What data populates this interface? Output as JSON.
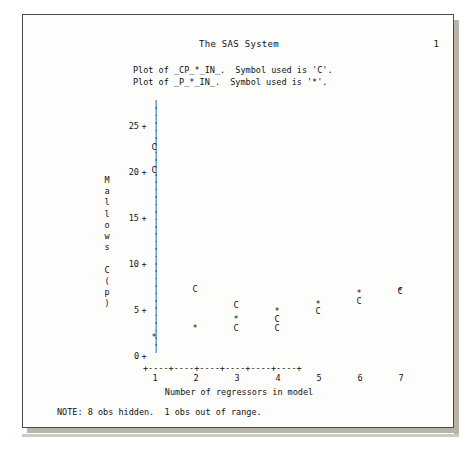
{
  "page": {
    "title": "The SAS System",
    "page_number": "1",
    "legend_line_1": "Plot of _CP_*_IN_.  Symbol used is 'C'.",
    "legend_line_2": "Plot of _P_*_IN_.  Symbol used is '*'.",
    "note": "NOTE: 8 obs hidden.  1 obs out of range."
  },
  "chart_data": {
    "type": "scatter",
    "title": "The SAS System",
    "xlabel": "Number of regressors in model",
    "ylabel": "Mallows C(p)",
    "ylabel_chars": [
      "M",
      "a",
      "l",
      "l",
      "o",
      "w",
      "s",
      "",
      "C",
      "(",
      "p",
      ")"
    ],
    "xlim": [
      1,
      7
    ],
    "ylim": [
      0,
      25
    ],
    "xticks": [
      "1",
      "2",
      "3",
      "4",
      "5",
      "6",
      "7"
    ],
    "yticks": [
      "25",
      "20",
      "15",
      "10",
      "5",
      "0"
    ],
    "grid": false,
    "legend_position": "top",
    "series": [
      {
        "name": "_CP_*_IN_",
        "symbol": "C",
        "points": [
          {
            "x": 1,
            "y": 23.0
          },
          {
            "x": 1,
            "y": 20.5
          },
          {
            "x": 2,
            "y": 7.6
          },
          {
            "x": 3,
            "y": 5.9
          },
          {
            "x": 3,
            "y": 3.4
          },
          {
            "x": 4,
            "y": 4.4
          },
          {
            "x": 4,
            "y": 3.4
          },
          {
            "x": 5,
            "y": 5.2
          },
          {
            "x": 6,
            "y": 6.3
          },
          {
            "x": 7,
            "y": 7.4
          }
        ]
      },
      {
        "name": "_P_*_IN_",
        "symbol": "*",
        "points": [
          {
            "x": 1,
            "y": 2.4
          },
          {
            "x": 2,
            "y": 3.4
          },
          {
            "x": 3,
            "y": 4.4
          },
          {
            "x": 4,
            "y": 5.2
          },
          {
            "x": 5,
            "y": 6.0
          },
          {
            "x": 6,
            "y": 7.2
          },
          {
            "x": 7,
            "y": 7.4
          }
        ]
      }
    ]
  },
  "axis": {
    "x_axis_line": "+----+----+----+----+----+----+",
    "vertical_axis_char": "|"
  }
}
